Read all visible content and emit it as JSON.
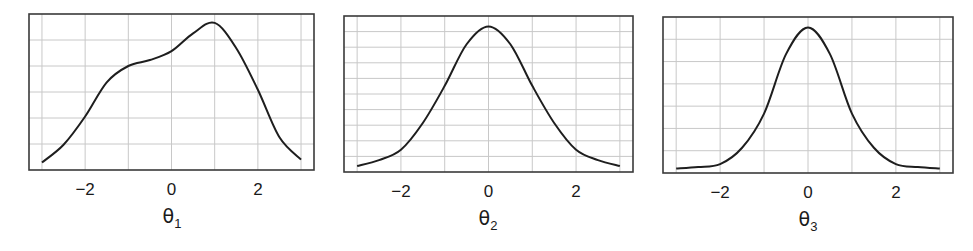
{
  "figure": {
    "background": "#ffffff",
    "frame_color": "#3a3a3a",
    "grid_color": "#c8c8c8",
    "curve_color": "#1e1e1e"
  },
  "chart_data": [
    {
      "type": "line",
      "title": "",
      "xlabel": "θ1",
      "xlabel_base": "θ",
      "xlabel_sub": "1",
      "ylabel": "",
      "xlim": [
        -3.3,
        3.3
      ],
      "ylim": [
        0,
        1.05
      ],
      "xticks": [
        -2,
        0,
        2
      ],
      "xtick_labels": [
        "−2",
        "0",
        "2"
      ],
      "x_gridlines": [
        -3,
        -2,
        -1,
        0,
        1,
        2,
        3
      ],
      "y_gridline_count": 5,
      "grid": true,
      "yticks_visible": false,
      "legend": null,
      "series": [
        {
          "name": "density θ1",
          "x": [
            -3.0,
            -2.5,
            -2.0,
            -1.5,
            -1.0,
            -0.5,
            0.0,
            0.5,
            1.0,
            1.5,
            2.0,
            2.5,
            3.0
          ],
          "y": [
            0.05,
            0.17,
            0.36,
            0.59,
            0.7,
            0.74,
            0.8,
            0.92,
            0.99,
            0.82,
            0.54,
            0.22,
            0.07
          ]
        }
      ]
    },
    {
      "type": "line",
      "title": "",
      "xlabel": "θ2",
      "xlabel_base": "θ",
      "xlabel_sub": "2",
      "ylabel": "",
      "xlim": [
        -3.3,
        3.3
      ],
      "ylim": [
        0,
        1.05
      ],
      "xticks": [
        -2,
        0,
        2
      ],
      "xtick_labels": [
        "−2",
        "0",
        "2"
      ],
      "x_gridlines": [
        -3,
        -2,
        -1,
        0,
        1,
        2,
        3
      ],
      "y_gridline_count": 9,
      "grid": true,
      "yticks_visible": false,
      "legend": null,
      "series": [
        {
          "name": "density θ2",
          "x": [
            -3.0,
            -2.5,
            -2.0,
            -1.5,
            -1.0,
            -0.5,
            0.0,
            0.5,
            1.0,
            1.5,
            2.0,
            2.5,
            3.0
          ],
          "y": [
            0.04,
            0.08,
            0.15,
            0.33,
            0.58,
            0.86,
            0.98,
            0.86,
            0.58,
            0.33,
            0.15,
            0.08,
            0.04
          ]
        }
      ]
    },
    {
      "type": "line",
      "title": "",
      "xlabel": "θ3",
      "xlabel_base": "θ",
      "xlabel_sub": "3",
      "ylabel": "",
      "xlim": [
        -3.3,
        3.3
      ],
      "ylim": [
        0,
        1.05
      ],
      "xticks": [
        -2,
        0,
        2
      ],
      "xtick_labels": [
        "−2",
        "0",
        "2"
      ],
      "x_gridlines": [
        -3,
        -2,
        -1,
        0,
        1,
        2,
        3
      ],
      "y_gridline_count": 6,
      "grid": true,
      "yticks_visible": false,
      "legend": null,
      "series": [
        {
          "name": "density θ3",
          "x": [
            -3.0,
            -2.5,
            -2.0,
            -1.5,
            -1.0,
            -0.5,
            0.0,
            0.5,
            1.0,
            1.5,
            2.0,
            2.5,
            3.0
          ],
          "y": [
            0.03,
            0.04,
            0.06,
            0.17,
            0.4,
            0.8,
            0.98,
            0.8,
            0.4,
            0.17,
            0.06,
            0.04,
            0.03
          ]
        }
      ]
    }
  ]
}
